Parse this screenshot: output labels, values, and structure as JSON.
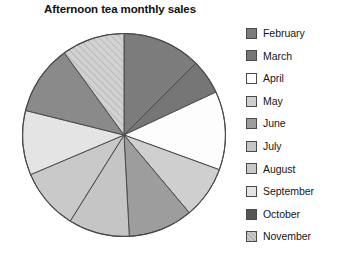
{
  "chart_data": {
    "type": "pie",
    "title": "Afternoon tea monthly sales",
    "xlabel": "",
    "ylabel": "",
    "legend_position": "right",
    "grid": false,
    "start_angle_deg": 0,
    "direction": "clockwise",
    "categories": [
      "February",
      "March",
      "April",
      "May",
      "June",
      "July",
      "August",
      "September",
      "October",
      "November"
    ],
    "values": [
      12.5,
      5.6,
      12.5,
      8.3,
      10.3,
      9.7,
      9.7,
      10.3,
      11.1,
      10.0
    ],
    "angles_deg": [
      45,
      20,
      45,
      30,
      37,
      35,
      35,
      37,
      40,
      36
    ],
    "slices": [
      {
        "label": "February",
        "value": 12.5,
        "angle_deg": 45,
        "color": "#7c7c7c",
        "pattern": "solid"
      },
      {
        "label": "March",
        "value": 5.6,
        "angle_deg": 20,
        "color": "#767676",
        "pattern": "solid"
      },
      {
        "label": "April",
        "value": 12.5,
        "angle_deg": 45,
        "color": "#fdfdfd",
        "pattern": "solid"
      },
      {
        "label": "May",
        "value": 8.3,
        "angle_deg": 30,
        "color": "#cfcfcf",
        "pattern": "solid"
      },
      {
        "label": "June",
        "value": 10.3,
        "angle_deg": 37,
        "color": "#9d9d9d",
        "pattern": "solid"
      },
      {
        "label": "July",
        "value": 9.7,
        "angle_deg": 35,
        "color": "#c5c5c5",
        "pattern": "solid"
      },
      {
        "label": "August",
        "value": 9.7,
        "angle_deg": 35,
        "color": "#c9c9c9",
        "pattern": "solid"
      },
      {
        "label": "September",
        "value": 10.3,
        "angle_deg": 37,
        "color": "#e4e4e4",
        "pattern": "solid"
      },
      {
        "label": "October",
        "value": 11.1,
        "angle_deg": 40,
        "color": "#8a8a8a",
        "pattern": "solid"
      },
      {
        "label": "November",
        "value": 10.0,
        "angle_deg": 36,
        "color": "#cbcbcb",
        "pattern": "diagonal-hatch"
      }
    ]
  },
  "legend": {
    "items": [
      {
        "label": "February",
        "color": "#7c7c7c",
        "pattern": "solid"
      },
      {
        "label": "March",
        "color": "#767676",
        "pattern": "solid"
      },
      {
        "label": "April",
        "color": "#fdfdfd",
        "pattern": "solid"
      },
      {
        "label": "May",
        "color": "#cfcfcf",
        "pattern": "solid"
      },
      {
        "label": "June",
        "color": "#9d9d9d",
        "pattern": "solid"
      },
      {
        "label": "July",
        "color": "#c5c5c5",
        "pattern": "solid"
      },
      {
        "label": "August",
        "color": "#c9c9c9",
        "pattern": "solid"
      },
      {
        "label": "September",
        "color": "#e4e4e4",
        "pattern": "solid"
      },
      {
        "label": "October",
        "color": "#555555",
        "pattern": "solid"
      },
      {
        "label": "November",
        "color": "#cbcbcb",
        "pattern": "diagonal-hatch"
      }
    ]
  },
  "style": {
    "background": "#ffffff",
    "outline": "#4a4a4a",
    "title_color": "#111111",
    "label_color": "#161616"
  }
}
